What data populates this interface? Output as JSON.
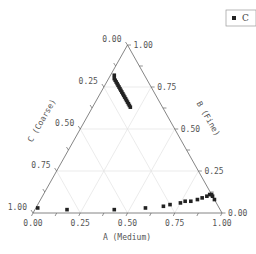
{
  "chart_data": {
    "type": "scatter",
    "subtype": "ternary",
    "title": "",
    "axes": {
      "A": {
        "label": "A (Medium)",
        "ticks": [
          "0.00",
          "0.25",
          "0.50",
          "0.75",
          "1.00"
        ]
      },
      "B": {
        "label": "B (Fine)",
        "ticks": [
          "0.00",
          "0.25",
          "0.50",
          "0.75",
          "1.00"
        ]
      },
      "C": {
        "label": "C (Coarse)",
        "ticks": [
          "0.00",
          "0.25",
          "0.50",
          "0.75",
          "1.00"
        ]
      }
    },
    "grid": true,
    "legend": {
      "position": "top-right",
      "entries": [
        "C"
      ]
    },
    "series": [
      {
        "name": "C",
        "marker": "square",
        "color": "#222222",
        "points_ABC": [
          [
            0.01,
            0.03,
            0.96
          ],
          [
            0.17,
            0.02,
            0.81
          ],
          [
            0.42,
            0.02,
            0.56
          ],
          [
            0.58,
            0.03,
            0.39
          ],
          [
            0.67,
            0.04,
            0.29
          ],
          [
            0.7,
            0.05,
            0.25
          ],
          [
            0.75,
            0.06,
            0.19
          ],
          [
            0.77,
            0.07,
            0.16
          ],
          [
            0.8,
            0.07,
            0.13
          ],
          [
            0.83,
            0.08,
            0.09
          ],
          [
            0.85,
            0.09,
            0.06
          ],
          [
            0.87,
            0.1,
            0.03
          ],
          [
            0.88,
            0.11,
            0.01
          ],
          [
            0.89,
            0.11,
            0.0
          ],
          [
            0.9,
            0.1,
            0.0
          ],
          [
            0.92,
            0.08,
            0.0
          ],
          [
            0.02,
            0.82,
            0.16
          ],
          [
            0.03,
            0.8,
            0.17
          ],
          [
            0.04,
            0.79,
            0.17
          ],
          [
            0.05,
            0.78,
            0.17
          ],
          [
            0.06,
            0.77,
            0.17
          ],
          [
            0.07,
            0.76,
            0.17
          ],
          [
            0.08,
            0.75,
            0.17
          ],
          [
            0.09,
            0.74,
            0.17
          ],
          [
            0.1,
            0.73,
            0.17
          ],
          [
            0.11,
            0.72,
            0.17
          ],
          [
            0.12,
            0.71,
            0.17
          ],
          [
            0.13,
            0.7,
            0.17
          ],
          [
            0.14,
            0.69,
            0.17
          ],
          [
            0.15,
            0.68,
            0.17
          ],
          [
            0.16,
            0.67,
            0.17
          ],
          [
            0.17,
            0.66,
            0.17
          ],
          [
            0.18,
            0.65,
            0.17
          ],
          [
            0.19,
            0.64,
            0.17
          ],
          [
            0.2,
            0.63,
            0.17
          ]
        ]
      }
    ]
  },
  "legend": {
    "label": "C"
  },
  "labels": {
    "a_axis": "A (Medium)",
    "b_axis": "B (Fine)",
    "c_axis": "C (Coarse)"
  },
  "ticks": [
    "0.00",
    "0.25",
    "0.50",
    "0.75",
    "1.00"
  ]
}
